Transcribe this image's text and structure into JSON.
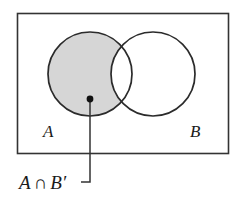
{
  "figure": {
    "kind": "venn-diagram",
    "universe": {
      "name": "universal-set-rectangle",
      "stroke": "#333333",
      "fill": "#ffffff",
      "x": 17,
      "y": 13,
      "width": 211,
      "height": 140
    },
    "circles": [
      {
        "id": "circle-a",
        "label": "A",
        "cx": 90,
        "cy": 74,
        "r": 42,
        "stroke": "#2b2b2b",
        "label_x": 43,
        "label_y": 137
      },
      {
        "id": "circle-b",
        "label": "B",
        "cx": 153,
        "cy": 74,
        "r": 42,
        "stroke": "#2b2b2b",
        "label_x": 190,
        "label_y": 137
      }
    ],
    "shaded_region": {
      "name": "a-minus-b-region",
      "description": "A intersect B complement",
      "fill": "#d6d6d6"
    },
    "callout": {
      "dot": {
        "cx": 90,
        "cy": 99,
        "r": 3.4,
        "fill": "#111111"
      },
      "leader": {
        "points": "90,99 90,182 81,182",
        "stroke": "#333333"
      },
      "text": "A ∩ B′",
      "text_parts": {
        "left": "A",
        "operator": "∩",
        "right": "B′"
      },
      "text_x": 19,
      "text_y": 189
    },
    "colors": {
      "ink": "#1a1a1a",
      "rule": "#333333",
      "shade": "#d6d6d6",
      "background": "#ffffff"
    }
  }
}
